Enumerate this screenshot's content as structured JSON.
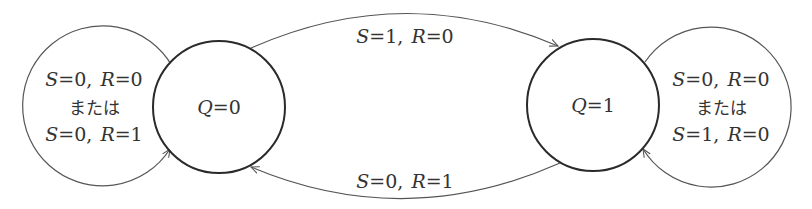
{
  "diagram": {
    "type": "state-transition",
    "colors": {
      "state_stroke": "#2a2a2a",
      "loop_stroke": "#555555",
      "text": "#333333",
      "background": "#ffffff"
    },
    "states": [
      {
        "id": "q0",
        "var": "Q",
        "eq": "=",
        "value": "0"
      },
      {
        "id": "q1",
        "var": "Q",
        "eq": "=",
        "value": "1"
      }
    ],
    "self_loops": [
      {
        "state": "q0",
        "line1": {
          "s": "S",
          "s_val": "=0,",
          "r": "R",
          "r_val": "=0"
        },
        "connector": "または",
        "line2": {
          "s": "S",
          "s_val": "=0,",
          "r": "R",
          "r_val": "=1"
        }
      },
      {
        "state": "q1",
        "line1": {
          "s": "S",
          "s_val": "=0,",
          "r": "R",
          "r_val": "=0"
        },
        "connector": "または",
        "line2": {
          "s": "S",
          "s_val": "=1,",
          "r": "R",
          "r_val": "=0"
        }
      }
    ],
    "transitions": [
      {
        "from": "q0",
        "to": "q1",
        "label": {
          "s": "S",
          "s_val": "=1,",
          "r": "R",
          "r_val": "=0"
        }
      },
      {
        "from": "q1",
        "to": "q0",
        "label": {
          "s": "S",
          "s_val": "=0,",
          "r": "R",
          "r_val": "=1"
        }
      }
    ]
  }
}
